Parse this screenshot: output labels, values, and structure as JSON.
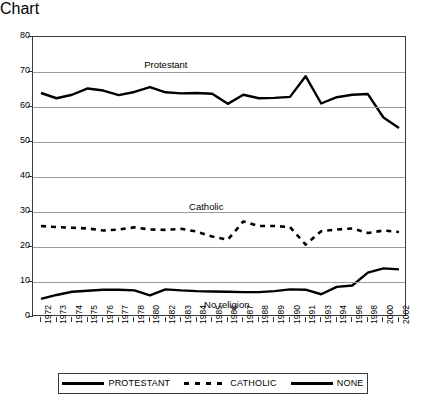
{
  "chart_data": {
    "type": "line",
    "title": "",
    "xlabel": "",
    "ylabel": "",
    "ylim": [
      0,
      80
    ],
    "ytick_step": 10,
    "yticks": [
      0,
      10,
      20,
      30,
      40,
      50,
      60,
      70,
      80
    ],
    "grid": true,
    "legend_position": "bottom",
    "categories": [
      "1972",
      "1973",
      "1974",
      "1975",
      "1976",
      "1977",
      "1978",
      "1980",
      "1982",
      "1983",
      "1984",
      "1985",
      "1986",
      "1987",
      "1988",
      "1989",
      "1990",
      "1991",
      "1993",
      "1994",
      "1996",
      "1998",
      "2000",
      "2002"
    ],
    "series": [
      {
        "name": "PROTESTANT",
        "style": "solid",
        "color": "#000000",
        "values": [
          64.0,
          62.5,
          63.5,
          65.3,
          64.7,
          63.4,
          64.3,
          65.7,
          64.2,
          63.9,
          64.0,
          63.8,
          60.9,
          63.5,
          62.5,
          62.6,
          62.9,
          68.8,
          61.0,
          62.8,
          63.5,
          63.7,
          57.0,
          54.0
        ]
      },
      {
        "name": "CATHOLIC",
        "style": "dashed",
        "color": "#000000",
        "values": [
          26.0,
          25.7,
          25.5,
          25.3,
          24.7,
          25.0,
          25.6,
          25.0,
          24.9,
          25.2,
          24.4,
          23.0,
          22.1,
          27.3,
          26.0,
          26.0,
          25.7,
          20.7,
          24.5,
          25.0,
          25.3,
          24.0,
          24.7,
          24.3
        ]
      },
      {
        "name": "NONE",
        "style": "solid",
        "color": "#000000",
        "values": [
          5.2,
          6.3,
          7.2,
          7.5,
          7.8,
          7.8,
          7.6,
          6.2,
          7.9,
          7.6,
          7.4,
          7.3,
          7.2,
          7.1,
          7.1,
          7.4,
          7.9,
          7.8,
          6.5,
          8.6,
          9.0,
          12.7,
          13.9,
          13.6
        ]
      }
    ],
    "annotations": [
      {
        "text": "Protestant",
        "x_frac": 0.3,
        "y_value": 71.5
      },
      {
        "text": "Catholic",
        "x_frac": 0.42,
        "y_value": 31.0
      },
      {
        "text": "No religion",
        "x_frac": 0.46,
        "y_value": 2.8
      }
    ]
  },
  "legend": {
    "entries": [
      {
        "label": "PROTESTANT",
        "style": "solid"
      },
      {
        "label": "CATHOLIC",
        "style": "dashed"
      },
      {
        "label": "NONE",
        "style": "solid"
      }
    ]
  }
}
